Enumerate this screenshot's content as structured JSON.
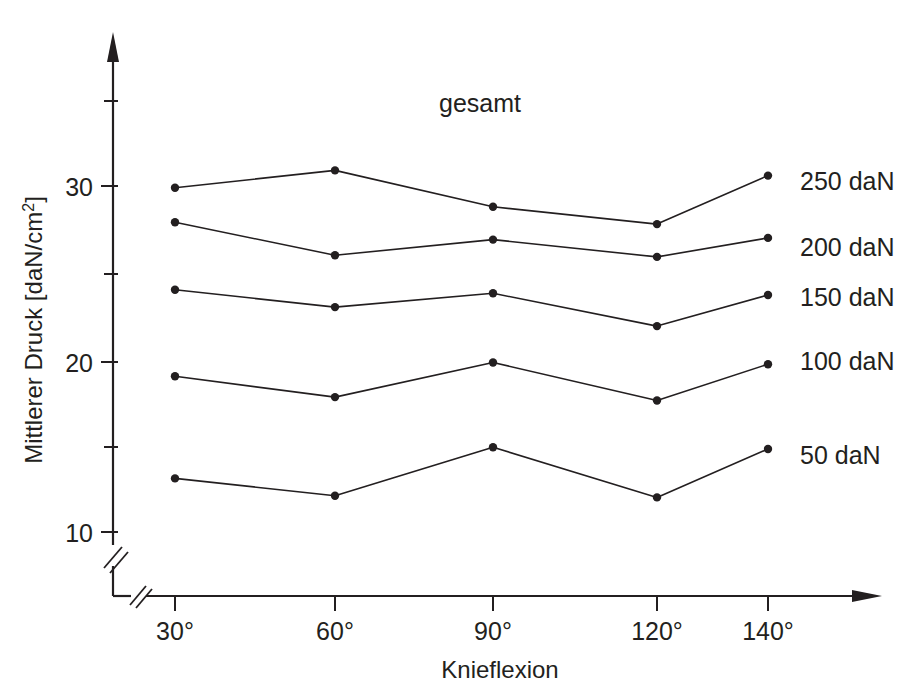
{
  "chart_data": {
    "type": "line",
    "title": "gesamt",
    "xlabel": "Knieflexion",
    "ylabel": "Mittlerer Druck [daN/cm²]",
    "ylabel_parts": {
      "main": "Mittlerer Druck [daN/cm",
      "superscript": "2",
      "tail": "]"
    },
    "categories": [
      "30°",
      "60°",
      "90°",
      "120°",
      "140°"
    ],
    "x_tick_labels": [
      "30°",
      "60°",
      "90°",
      "120°",
      "140°"
    ],
    "y_tick_labels": [
      "10",
      "20",
      "30"
    ],
    "y_major_ticks": [
      10,
      20,
      30
    ],
    "y_minor_ticks": [
      15,
      25,
      35
    ],
    "ylim": [
      7,
      36
    ],
    "axis_break_y": true,
    "axis_break_x": true,
    "grid": false,
    "legend_position": "right-inline",
    "line_color": "#231f20",
    "marker_color": "#231f20",
    "series": [
      {
        "name": "250 daN",
        "label": "250 daN",
        "values": [
          29.9,
          30.9,
          28.8,
          27.8,
          30.6
        ]
      },
      {
        "name": "200 daN",
        "label": "200 daN",
        "values": [
          27.9,
          26.0,
          26.9,
          25.9,
          27.0
        ]
      },
      {
        "name": "150 daN",
        "label": "150 daN",
        "values": [
          24.0,
          23.0,
          23.8,
          21.9,
          23.7
        ]
      },
      {
        "name": "100 daN",
        "label": "100 daN",
        "values": [
          19.0,
          17.8,
          19.8,
          17.6,
          19.7
        ]
      },
      {
        "name": "50 daN",
        "label": "50 daN",
        "values": [
          13.1,
          12.1,
          14.9,
          12.0,
          14.8
        ]
      }
    ]
  },
  "labels": {
    "title": "gesamt",
    "xlabel": "Knieflexion",
    "ylabel_main": "Mittlerer Druck [daN/cm",
    "ylabel_sup": "2",
    "ylabel_tail": "]",
    "y_tick_10": "10",
    "y_tick_20": "20",
    "y_tick_30": "30",
    "x_tick_0": "30°",
    "x_tick_1": "60°",
    "x_tick_2": "90°",
    "x_tick_3": "120°",
    "x_tick_4": "140°",
    "series_0": "250 daN",
    "series_1": "200 daN",
    "series_2": "150 daN",
    "series_3": "100 daN",
    "series_4": "50 daN"
  }
}
